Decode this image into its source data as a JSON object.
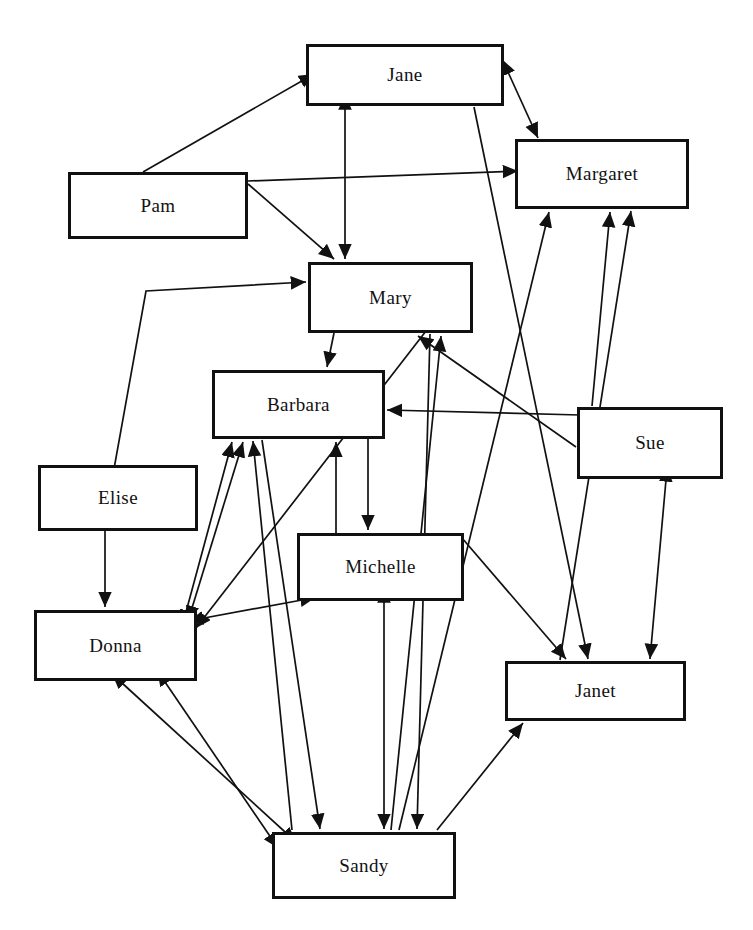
{
  "diagram": {
    "type": "directed-graph",
    "width": 753,
    "height": 930,
    "background": "#ffffff",
    "node_fill": "#ffffff",
    "node_stroke": "#111111",
    "edge_stroke": "#111111"
  },
  "nodes": [
    {
      "id": "jane",
      "label": "Jane",
      "x": 306,
      "y": 44,
      "w": 198,
      "h": 62
    },
    {
      "id": "margaret",
      "label": "Margaret",
      "x": 515,
      "y": 139,
      "w": 174,
      "h": 70
    },
    {
      "id": "pam",
      "label": "Pam",
      "x": 68,
      "y": 172,
      "w": 180,
      "h": 67
    },
    {
      "id": "mary",
      "label": "Mary",
      "x": 308,
      "y": 262,
      "w": 165,
      "h": 71
    },
    {
      "id": "barbara",
      "label": "Barbara",
      "x": 212,
      "y": 370,
      "w": 173,
      "h": 69
    },
    {
      "id": "sue",
      "label": "Sue",
      "x": 577,
      "y": 407,
      "w": 146,
      "h": 72
    },
    {
      "id": "elise",
      "label": "Elise",
      "x": 38,
      "y": 465,
      "w": 160,
      "h": 66
    },
    {
      "id": "michelle",
      "label": "Michelle",
      "x": 297,
      "y": 533,
      "w": 167,
      "h": 68
    },
    {
      "id": "donna",
      "label": "Donna",
      "x": 34,
      "y": 610,
      "w": 163,
      "h": 71
    },
    {
      "id": "janet",
      "label": "Janet",
      "x": 505,
      "y": 661,
      "w": 181,
      "h": 60
    },
    {
      "id": "sandy",
      "label": "Sandy",
      "x": 272,
      "y": 832,
      "w": 184,
      "h": 67
    }
  ],
  "edges": [
    {
      "from": "pam",
      "to": "jane",
      "arrows": "one",
      "points": "143,172 314,74"
    },
    {
      "from": "pam",
      "to": "mary",
      "arrows": "one",
      "points": "248,184 334,259"
    },
    {
      "from": "pam",
      "to": "margaret",
      "arrows": "one",
      "points": "248,181 518,171"
    },
    {
      "from": "jane",
      "to": "margaret",
      "arrows": "both",
      "points": "508,72 538,138"
    },
    {
      "from": "jane",
      "to": "mary",
      "arrows": "both",
      "points": "345,108 345,259"
    },
    {
      "from": "elise",
      "to": "mary",
      "arrows": "one",
      "points": "103,530 146,291 306,282"
    },
    {
      "from": "elise",
      "to": "donna",
      "arrows": "one",
      "points": "105,531 105,607"
    },
    {
      "from": "mary",
      "to": "barbara",
      "arrows": "one",
      "points": "334,333 327,367"
    },
    {
      "from": "sue",
      "to": "barbara",
      "arrows": "one",
      "points": "580,415 387,410"
    },
    {
      "from": "sue",
      "to": "mary",
      "arrows": "one",
      "points": "576,447 418,336"
    },
    {
      "from": "sue",
      "to": "margaret",
      "arrows": "one",
      "points": "592,406 610,212"
    },
    {
      "from": "sue",
      "to": "janet",
      "arrows": "both",
      "points": "666,480 650,659"
    },
    {
      "from": "janet",
      "to": "margaret",
      "arrows": "one",
      "points": "560,660 631,211"
    },
    {
      "from": "sandy",
      "to": "margaret",
      "arrows": "one",
      "points": "399,830 549,212"
    },
    {
      "from": "sandy",
      "to": "janet",
      "arrows": "one",
      "points": "437,830 523,723"
    },
    {
      "from": "michelle",
      "to": "janet",
      "arrows": "one",
      "points": "462,538 566,659"
    },
    {
      "from": "jane",
      "to": "janet",
      "arrows": "one",
      "points": "474,107 588,659"
    },
    {
      "from": "mary",
      "to": "sandy",
      "arrows": "one",
      "points": "430,334 417,829"
    },
    {
      "from": "sandy",
      "to": "mary",
      "arrows": "one",
      "points": "391,830 441,336"
    },
    {
      "from": "barbara",
      "to": "michelle",
      "arrows": "one",
      "points": "368,439 368,530"
    },
    {
      "from": "michelle",
      "to": "barbara",
      "arrows": "one",
      "points": "336,533 336,442"
    },
    {
      "from": "michelle",
      "to": "donna",
      "arrows": "both",
      "points": "302,600 188,621"
    },
    {
      "from": "michelle",
      "to": "sandy",
      "arrows": "both",
      "points": "384,601 384,829"
    },
    {
      "from": "donna",
      "to": "barbara",
      "arrows": "both",
      "points": "192,608 243,442"
    },
    {
      "from": "donna",
      "to": "barbara",
      "arrows": "both",
      "points": "186,612 232,442"
    },
    {
      "from": "barbara",
      "to": "sandy",
      "arrows": "one",
      "points": "262,440 320,829"
    },
    {
      "from": "sandy",
      "to": "barbara",
      "arrows": "one",
      "points": "292,830 253,441"
    },
    {
      "from": "donna",
      "to": "sandy",
      "arrows": "both",
      "points": "122,683 296,842"
    },
    {
      "from": "donna",
      "to": "sandy",
      "arrows": "both",
      "points": "165,682 278,848"
    },
    {
      "from": "mary",
      "to": "donna",
      "arrows": "one",
      "points": "450,300 196,628"
    }
  ]
}
